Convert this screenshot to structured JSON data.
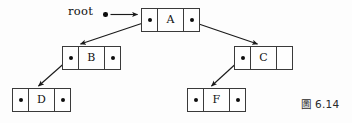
{
  "figure": {
    "caption": "圖 6.14",
    "root_label": "root",
    "background_color": "#fdfdfd",
    "line_color": "#3a3a3a",
    "dot_color": "#0d0d0d",
    "width": 352,
    "height": 123
  },
  "nodes": [
    {
      "id": "A",
      "data": "A",
      "left_pointer": "dot",
      "right_pointer": "dot",
      "x": 141,
      "y": 8
    },
    {
      "id": "B",
      "data": "B",
      "left_pointer": "dot",
      "right_pointer": "dot",
      "x": 62,
      "y": 46
    },
    {
      "id": "C",
      "data": "C",
      "left_pointer": "dot",
      "right_pointer": "empty",
      "x": 234,
      "y": 46
    },
    {
      "id": "D",
      "data": "D",
      "left_pointer": "dot",
      "right_pointer": "dot",
      "x": 12,
      "y": 88
    },
    {
      "id": "F",
      "data": "F",
      "left_pointer": "dot",
      "right_pointer": "dot",
      "x": 187,
      "y": 88
    }
  ],
  "edges": [
    {
      "from": "root",
      "to": "A",
      "label": "root-pointer"
    },
    {
      "from": "A",
      "to": "B",
      "label": "A-left-child"
    },
    {
      "from": "A",
      "to": "C",
      "label": "A-right-child"
    },
    {
      "from": "B",
      "to": "D",
      "label": "B-left-child"
    },
    {
      "from": "C",
      "to": "F",
      "label": "C-left-child"
    }
  ]
}
